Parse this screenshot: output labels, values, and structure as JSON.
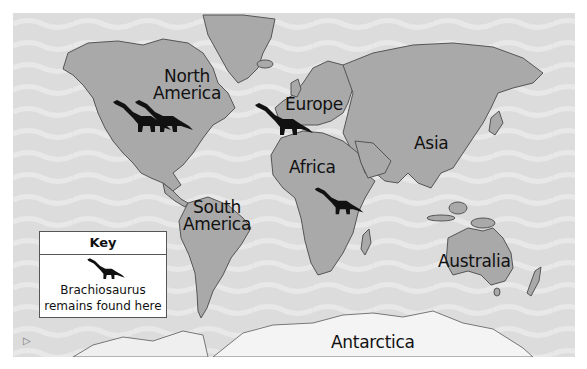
{
  "map": {
    "title": "World map of Brachiosaurus remains",
    "colors": {
      "ocean": "#dcdcdc",
      "ocean_wave": "#e6e6e6",
      "land": "#a9a9a9",
      "land_outline": "#555555",
      "antarctica": "#f4f4f4",
      "dinosaur": "#111111",
      "label": "#111111"
    },
    "labels": {
      "north_america": "North\nAmerica",
      "south_america": "South\nAmerica",
      "europe": "Europe",
      "africa": "Africa",
      "asia": "Asia",
      "australia": "Australia",
      "antarctica": "Antarctica"
    },
    "markers": [
      {
        "name": "north-america-west",
        "location": "North America"
      },
      {
        "name": "north-america-east",
        "location": "North America"
      },
      {
        "name": "europe-iberia",
        "location": "Europe"
      },
      {
        "name": "east-africa",
        "location": "Africa"
      }
    ]
  },
  "key": {
    "title": "Key",
    "icon": "brachiosaurus-icon",
    "description_line1": "Brachiosaurus",
    "description_line2": "remains found here"
  }
}
